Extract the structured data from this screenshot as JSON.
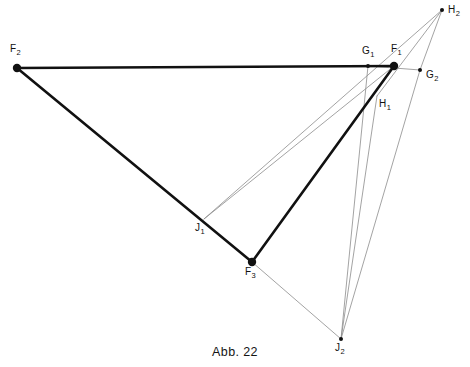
{
  "figure": {
    "caption": "Abb. 22",
    "top_cropped_text": "",
    "width": 470,
    "height": 367,
    "background_color": "#ffffff"
  },
  "style": {
    "thick_line_color": "#111111",
    "thick_line_width": 2.6,
    "thin_line_color": "#8b8b8b",
    "thin_line_width": 0.8,
    "vertex_dot_color": "#111111",
    "label_color": "#111111"
  },
  "points": [
    {
      "id": "F2",
      "label": "F",
      "sub": "2",
      "x": 17,
      "y": 68,
      "dot": "large",
      "label_x": 10,
      "label_y": 44
    },
    {
      "id": "G1",
      "label": "G",
      "sub": "1",
      "x": 368,
      "y": 66,
      "dot": "small",
      "label_x": 362,
      "label_y": 46
    },
    {
      "id": "F1",
      "label": "F",
      "sub": "1",
      "x": 394,
      "y": 66,
      "dot": "large",
      "label_x": 391,
      "label_y": 44
    },
    {
      "id": "G2",
      "label": "G",
      "sub": "2",
      "x": 420,
      "y": 70,
      "dot": "small",
      "label_x": 426,
      "label_y": 70
    },
    {
      "id": "H2",
      "label": "H",
      "sub": "2",
      "x": 442,
      "y": 10,
      "dot": "small",
      "label_x": 448,
      "label_y": 5
    },
    {
      "id": "H1",
      "label": "H",
      "sub": "1",
      "x": 377,
      "y": 96,
      "dot": "none",
      "label_x": 379,
      "label_y": 99
    },
    {
      "id": "J1",
      "label": "J",
      "sub": "1",
      "x": 204,
      "y": 219,
      "dot": "none",
      "label_x": 195,
      "label_y": 223
    },
    {
      "id": "F3",
      "label": "F",
      "sub": "3",
      "x": 252,
      "y": 262,
      "dot": "large",
      "label_x": 245,
      "label_y": 267
    },
    {
      "id": "J2",
      "label": "J",
      "sub": "2",
      "x": 341,
      "y": 339,
      "dot": "small",
      "label_x": 335,
      "label_y": 343
    }
  ],
  "thick_segments": [
    {
      "name": "F2-F1",
      "from": "F2",
      "to": "F1"
    },
    {
      "name": "F2-F3",
      "from": "F2",
      "to": "F3"
    },
    {
      "name": "F3-F1",
      "from": "F3",
      "to": "F1"
    }
  ],
  "thin_segments": [
    {
      "name": "G1-G2",
      "from": "G1",
      "to": "G2"
    },
    {
      "name": "J1-F1",
      "from": "J1",
      "to": "F1"
    },
    {
      "name": "J1-H2",
      "from": "J1",
      "to": "H2"
    },
    {
      "name": "G1-J2",
      "from": "G1",
      "to": "J2"
    },
    {
      "name": "G2-H2",
      "from": "G2",
      "to": "H2"
    },
    {
      "name": "G2-J2",
      "from": "G2",
      "to": "J2"
    },
    {
      "name": "F3-J2",
      "from": "F3",
      "to": "J2"
    },
    {
      "name": "H1-H2",
      "from": "H1",
      "to": "H2"
    },
    {
      "name": "H1-J2",
      "from": "H1",
      "to": "J2"
    }
  ]
}
